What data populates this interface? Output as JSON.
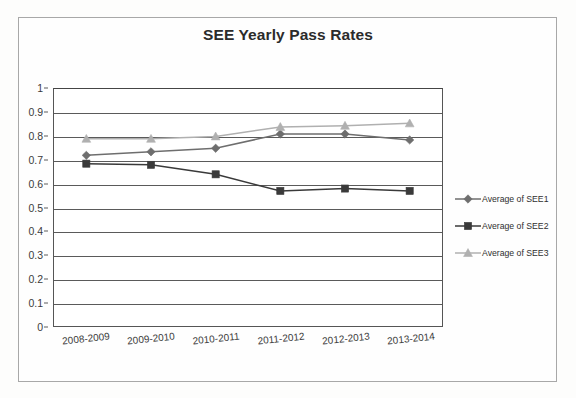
{
  "chart_data": {
    "type": "line",
    "title": "SEE Yearly Pass Rates",
    "xlabel": "",
    "ylabel": "",
    "ylim": [
      0,
      1
    ],
    "ytick_labels": [
      "1",
      "0.9",
      "0.8",
      "0.7",
      "0.6",
      "0.5",
      "0.4",
      "0.3",
      "0.2",
      "0.1",
      "0"
    ],
    "ytick_values": [
      1,
      0.9,
      0.8,
      0.7,
      0.6,
      0.5,
      0.4,
      0.3,
      0.2,
      0.1,
      0
    ],
    "grid": true,
    "legend_position": "right",
    "categories": [
      "2008-2009",
      "2009-2010",
      "2010-2011",
      "2011-2012",
      "2012-2013",
      "2013-2014"
    ],
    "series": [
      {
        "name": "Average of SEE1",
        "marker": "diamond",
        "color": "#6e6e6e",
        "values": [
          0.72,
          0.735,
          0.75,
          0.81,
          0.81,
          0.785
        ]
      },
      {
        "name": "Average of SEE2",
        "marker": "square",
        "color": "#3a3a3a",
        "values": [
          0.685,
          0.68,
          0.64,
          0.57,
          0.58,
          0.57
        ]
      },
      {
        "name": "Average of SEE3",
        "marker": "triangle",
        "color": "#b0b0b0",
        "values": [
          0.79,
          0.79,
          0.8,
          0.84,
          0.845,
          0.855
        ]
      }
    ]
  },
  "legend": {
    "items": [
      {
        "label": "Average of SEE1"
      },
      {
        "label": "Average of SEE2"
      },
      {
        "label": "Average of SEE3"
      }
    ]
  },
  "colors": {
    "series1": "#6e6e6e",
    "series2": "#3a3a3a",
    "series3": "#b0b0b0",
    "axis": "#555555",
    "grid": "#5a5a5a",
    "text": "#2b2b2b",
    "frame": "#a8a8a8"
  }
}
